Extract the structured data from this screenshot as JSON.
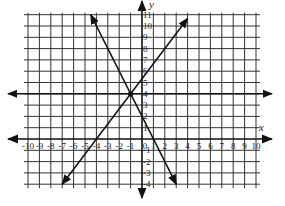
{
  "chart_data": {
    "type": "line",
    "title": "",
    "xlabel": "x",
    "ylabel": "y",
    "xlim": [
      -10,
      10
    ],
    "ylim": [
      -4,
      11
    ],
    "grid": true,
    "x_ticks": [
      -10,
      -9,
      -8,
      -7,
      -6,
      -5,
      -4,
      -3,
      -2,
      -1,
      0,
      1,
      2,
      3,
      4,
      5,
      6,
      7,
      8,
      9,
      10
    ],
    "y_ticks": [
      -4,
      -3,
      -2,
      -1,
      1,
      2,
      3,
      4,
      5,
      6,
      7,
      8,
      9,
      10,
      11
    ],
    "series": [
      {
        "name": "y = 4",
        "equation": "y = 4",
        "points": [
          [
            -10,
            4
          ],
          [
            10,
            4
          ]
        ],
        "arrows": "both"
      },
      {
        "name": "y = -2x + 2",
        "equation": "y = -2x + 2",
        "points": [
          [
            -4.5,
            11
          ],
          [
            3,
            -4
          ]
        ],
        "arrows": "both"
      },
      {
        "name": "y = (4/3)x + 16/3",
        "equation": "y = (4/3)x + 16/3",
        "points": [
          [
            -7,
            -4
          ],
          [
            4,
            10.67
          ]
        ],
        "arrows": "both"
      }
    ],
    "intersection": [
      -1,
      4
    ],
    "annotations": [
      "x",
      "y"
    ]
  }
}
